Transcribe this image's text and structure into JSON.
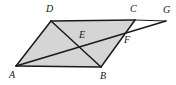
{
  "figure": {
    "kind": "geometry-diagram",
    "caption": "",
    "background_color": "#ffffff",
    "fill_color": "#d5d5d5",
    "stroke_color": "#1a1a1a",
    "label_color": "#161616",
    "labels": {
      "A": "A",
      "B": "B",
      "C": "C",
      "D": "D",
      "E": "E",
      "F": "F",
      "G": "G"
    }
  },
  "chart_data": {
    "type": "diagram",
    "title": "",
    "xlabel": "",
    "ylabel": "",
    "points": [
      {
        "name": "A",
        "x": 16,
        "y": 66,
        "label_x": 9,
        "label_y": 70,
        "role": "parallelogram-vertex"
      },
      {
        "name": "B",
        "x": 101,
        "y": 67,
        "label_x": 100,
        "label_y": 71,
        "role": "parallelogram-vertex"
      },
      {
        "name": "C",
        "x": 135,
        "y": 20,
        "label_x": 130,
        "label_y": 4,
        "role": "parallelogram-vertex"
      },
      {
        "name": "D",
        "x": 51,
        "y": 21,
        "label_x": 46,
        "label_y": 4,
        "role": "parallelogram-vertex"
      },
      {
        "name": "E",
        "x": 80,
        "y": 46,
        "label_x": 79,
        "label_y": 30,
        "role": "intersection-DB-AG"
      },
      {
        "name": "F",
        "x": 126,
        "y": 35,
        "label_x": 124,
        "label_y": 35,
        "role": "intersection-BC-AG"
      },
      {
        "name": "G",
        "x": 166,
        "y": 21,
        "label_x": 163,
        "label_y": 5,
        "role": "ray-endpoint"
      }
    ],
    "polygons": [
      {
        "name": "parallelogram-ABCD",
        "vertices": [
          "A",
          "B",
          "C",
          "D"
        ],
        "filled": true
      }
    ],
    "segments": [
      {
        "name": "segment-AB",
        "from": "A",
        "to": "B"
      },
      {
        "name": "segment-BC",
        "from": "B",
        "to": "C"
      },
      {
        "name": "segment-CD",
        "from": "C",
        "to": "D"
      },
      {
        "name": "segment-DA",
        "from": "D",
        "to": "A"
      },
      {
        "name": "segment-DB",
        "from": "D",
        "to": "B"
      },
      {
        "name": "segment-AG",
        "from": "A",
        "to": "G"
      },
      {
        "name": "segment-CG",
        "from": "C",
        "to": "G"
      }
    ]
  }
}
